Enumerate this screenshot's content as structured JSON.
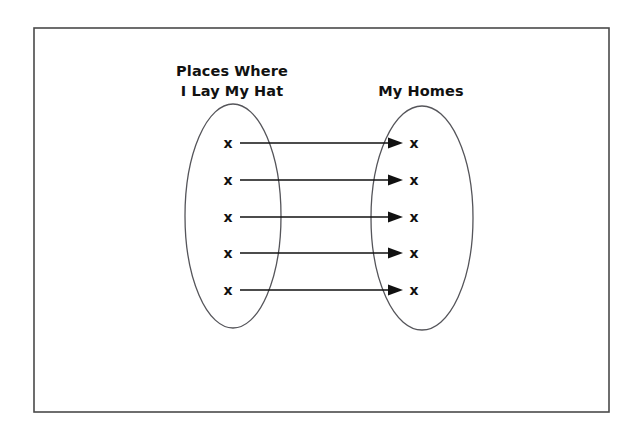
{
  "diagram": {
    "type": "mapping-diagram",
    "background_color": "#ffffff",
    "frame": {
      "stroke_color": "#4a4a4a",
      "x": 34,
      "y": 28,
      "width": 575,
      "height": 384
    },
    "domain_set": {
      "name": "places-where-i-lay-my-hat",
      "label_lines": [
        "Places Where",
        "I Lay My Hat"
      ],
      "label_line_1": "Places Where",
      "label_line_2": "I Lay My Hat",
      "element_count": 5,
      "element_marks": [
        "x",
        "x",
        "x",
        "x",
        "x"
      ],
      "ellipse": {
        "cx": 233,
        "cy": 216,
        "rx": 48,
        "ry": 112
      },
      "stroke_color": "#55555a"
    },
    "codomain_set": {
      "name": "my-homes",
      "label_lines": [
        "My Homes"
      ],
      "label_line_1": "My Homes",
      "element_count": 5,
      "element_marks": [
        "x",
        "x",
        "x",
        "x",
        "x"
      ],
      "ellipse": {
        "cx": 422,
        "cy": 218,
        "rx": 51,
        "ry": 112
      },
      "stroke_color": "#55555a"
    },
    "mappings": [
      {
        "from_index": 0,
        "to_index": 0,
        "y": 143
      },
      {
        "from_index": 1,
        "to_index": 1,
        "y": 180
      },
      {
        "from_index": 2,
        "to_index": 2,
        "y": 217
      },
      {
        "from_index": 3,
        "to_index": 3,
        "y": 253
      },
      {
        "from_index": 4,
        "to_index": 4,
        "y": 290
      }
    ],
    "arrow_color": "#111111",
    "element_mark_glyph": "x"
  }
}
